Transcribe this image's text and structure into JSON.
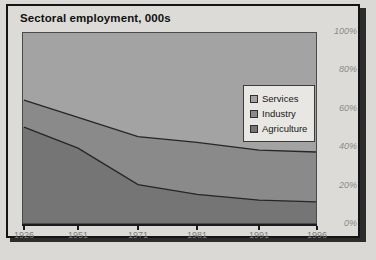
{
  "chart_title": "Sectoral employment, 000s",
  "legend": {
    "position": "inside-top-right",
    "entries": [
      {
        "label": "Services",
        "color": "#a0a0a0",
        "swatch": "services-swatch"
      },
      {
        "label": "Industry",
        "color": "#848484",
        "swatch": "industry-swatch"
      },
      {
        "label": "Agriculture",
        "color": "#6e6e6e",
        "swatch": "agriculture-swatch"
      }
    ]
  },
  "y_axis": {
    "ticks": [
      "100%",
      "80%",
      "60%",
      "40%",
      "20%",
      "0%"
    ],
    "tick_values": [
      100,
      80,
      60,
      40,
      20,
      0
    ],
    "color": "#8a8a8a",
    "style": "italic"
  },
  "x_axis": {
    "ticks": [
      "1926",
      "1951",
      "1971",
      "1981",
      "1991",
      "1996"
    ],
    "color": "#7c7c7c"
  },
  "colors": {
    "frame_border": "#141414",
    "frame_background": "#dddbd7",
    "page_background": "#dcdad6",
    "plot_background": "#8e8e8e",
    "services_band": "#a0a0a0",
    "industry_band": "#848484",
    "agriculture_band": "#6e6e6e",
    "series_line": "#2a2a2a",
    "title_text": "#111111"
  },
  "chart_data": {
    "type": "area",
    "title": "Sectoral employment, 000s",
    "subtitle": "",
    "xlabel": "",
    "ylabel": "",
    "stacked": true,
    "normalized": true,
    "grid": false,
    "legend_position": "inside-top-right",
    "x": [
      1926,
      1951,
      1971,
      1981,
      1991,
      1996
    ],
    "categories": [
      "1926",
      "1951",
      "1971",
      "1981",
      "1991",
      "1996"
    ],
    "ylim": [
      0,
      100
    ],
    "ytick_labels": [
      "0%",
      "20%",
      "40%",
      "60%",
      "80%",
      "100%"
    ],
    "series": [
      {
        "name": "Agriculture",
        "color": "#6e6e6e",
        "values": [
          51,
          40,
          21,
          16,
          13,
          12
        ],
        "note": "bottom band, share of total employment (%)"
      },
      {
        "name": "Industry",
        "color": "#848484",
        "values": [
          14,
          16,
          25,
          27,
          26,
          26
        ],
        "note": "middle band, share of total employment (%)"
      },
      {
        "name": "Services",
        "color": "#a0a0a0",
        "values": [
          35,
          44,
          54,
          57,
          61,
          62
        ],
        "note": "top band, share of total employment (%)"
      }
    ],
    "cumulative_boundaries": {
      "agriculture_top": [
        51,
        40,
        21,
        16,
        13,
        12
      ],
      "industry_top": [
        65,
        56,
        46,
        43,
        39,
        38
      ]
    }
  }
}
